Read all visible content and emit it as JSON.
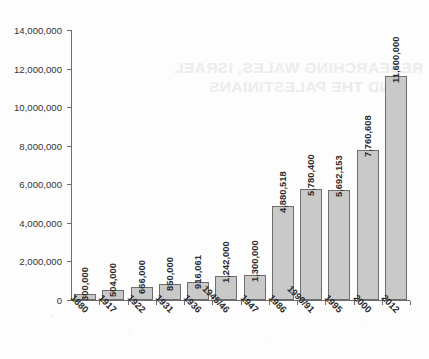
{
  "chart_data": {
    "type": "bar",
    "title": "",
    "xlabel": "",
    "ylabel": "",
    "ylim": [
      0,
      14000000
    ],
    "ytick_values": [
      0,
      2000000,
      4000000,
      6000000,
      8000000,
      10000000,
      12000000,
      14000000
    ],
    "ytick_labels": [
      "0",
      "2,000,000",
      "4,000,000",
      "6,000,000",
      "8,000,000",
      "10,000,000",
      "12,000,000",
      "14,000,000"
    ],
    "grid": false,
    "legend": false,
    "categories": [
      "1880",
      "1917",
      "1922",
      "1931",
      "1936",
      "1945/46",
      "1947",
      "1986",
      "1990/91",
      "1995",
      "2000",
      "2012"
    ],
    "values": [
      300000,
      504000,
      666000,
      850000,
      916061,
      1242000,
      1300000,
      4880518,
      5780400,
      5692153,
      7760608,
      11600000
    ],
    "value_labels": [
      "300,000",
      "504,000",
      "666,000",
      "850,000",
      "916,061",
      "1,242,000",
      "1,300,000",
      "4,880,518",
      "5,780,400",
      "5,692,153",
      "7,760,608",
      "11,600,000"
    ],
    "bar_fill_color": "#c9c9c9",
    "bar_border_color": "#6e6e6e",
    "axis_color": "#6d6d6d"
  },
  "watermark": {
    "line1": "RESEARCHING WALES, ISRAEL",
    "line2": "AND THE PALESTINIANS"
  }
}
